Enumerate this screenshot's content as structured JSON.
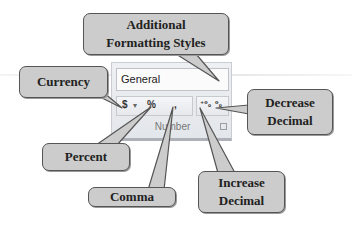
{
  "ribbon": {
    "number_format_value": "General",
    "buttons": {
      "currency": "$",
      "currency_dropdown": "▾",
      "percent": "%",
      "comma": ",",
      "increase_decimal": "⁺⁰₀",
      "decrease_decimal": "⁰₀"
    },
    "group_label": "Number"
  },
  "callouts": {
    "additional_formatting": [
      "Additional",
      "Formatting Styles"
    ],
    "currency": [
      "Currency"
    ],
    "decrease_decimal": [
      "Decrease",
      "Decimal"
    ],
    "percent": [
      "Percent"
    ],
    "comma": [
      "Comma"
    ],
    "increase_decimal": [
      "Increase",
      "Decimal"
    ]
  },
  "colors": {
    "callout_fill": "#cccccc",
    "callout_border": "#555555",
    "panel_bg": "#e8eaee"
  }
}
